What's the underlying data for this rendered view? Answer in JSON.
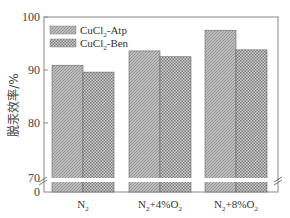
{
  "chart_data": {
    "type": "bar",
    "title": "",
    "xlabel": "",
    "ylabel": "脱汞效率/%",
    "categories": [
      "N₂",
      "N₂+4%O₂",
      "N₂+8%O₂"
    ],
    "series": [
      {
        "name": "CuCl₂-Atp",
        "values": [
          90.9,
          93.6,
          97.5
        ]
      },
      {
        "name": "CuCl₂-Ben",
        "values": [
          89.6,
          92.5,
          93.8
        ]
      }
    ],
    "yticks": [
      0,
      70,
      80,
      90,
      100
    ],
    "ylim": [
      0,
      100
    ],
    "axis_break": [
      0,
      70
    ],
    "grid": false,
    "legend_position": "upper left"
  },
  "labels": {
    "ylabel": "脱汞效率/%",
    "legend": [
      "CuCl",
      "-Atp",
      "CuCl",
      "-Ben"
    ],
    "yticks": [
      "100",
      "90",
      "80",
      "70",
      "0"
    ],
    "xcat": [
      {
        "main": "N",
        "sub": "2",
        "rest": ""
      },
      {
        "main": "N",
        "sub": "2",
        "rest": "+4%O",
        "sub2": "2"
      },
      {
        "main": "N",
        "sub": "2",
        "rest": "+8%O",
        "sub2": "2"
      }
    ]
  }
}
